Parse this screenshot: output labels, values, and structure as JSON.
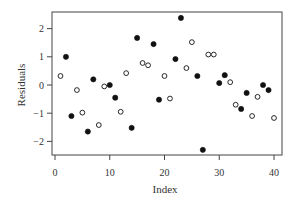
{
  "chart_data": {
    "type": "scatter",
    "title": "",
    "xlabel": "Index",
    "ylabel": "Residuals",
    "xlim": [
      -0.5,
      41.5
    ],
    "ylim": [
      -2.5,
      2.6
    ],
    "xticks": [
      0,
      10,
      20,
      30,
      40
    ],
    "yticks": [
      -2,
      -1,
      0,
      1,
      2
    ],
    "grid": false,
    "legend": null,
    "series": [
      {
        "name": "filled",
        "marker": "filled-circle",
        "color": "#111111",
        "points": [
          [
            2,
            1.0
          ],
          [
            3,
            -1.1
          ],
          [
            6,
            -1.65
          ],
          [
            7,
            0.2
          ],
          [
            10,
            0.0
          ],
          [
            11,
            -0.45
          ],
          [
            14,
            -1.52
          ],
          [
            15,
            1.67
          ],
          [
            18,
            1.45
          ],
          [
            19,
            -0.52
          ],
          [
            22,
            0.92
          ],
          [
            23,
            2.38
          ],
          [
            26,
            0.32
          ],
          [
            27,
            -2.3
          ],
          [
            30,
            0.07
          ],
          [
            31,
            0.35
          ],
          [
            34,
            -0.85
          ],
          [
            35,
            -0.28
          ],
          [
            38,
            0.0
          ],
          [
            39,
            -0.18
          ]
        ]
      },
      {
        "name": "open",
        "marker": "open-circle",
        "color": "#111111",
        "points": [
          [
            1,
            0.32
          ],
          [
            4,
            -0.18
          ],
          [
            5,
            -0.98
          ],
          [
            8,
            -1.42
          ],
          [
            9,
            -0.05
          ],
          [
            12,
            -0.95
          ],
          [
            13,
            0.42
          ],
          [
            16,
            0.78
          ],
          [
            17,
            0.7
          ],
          [
            20,
            0.32
          ],
          [
            21,
            -0.48
          ],
          [
            24,
            0.6
          ],
          [
            25,
            1.52
          ],
          [
            28,
            1.08
          ],
          [
            29,
            1.08
          ],
          [
            32,
            0.1
          ],
          [
            33,
            -0.7
          ],
          [
            36,
            -1.1
          ],
          [
            37,
            -0.42
          ],
          [
            40,
            -1.17
          ]
        ]
      }
    ]
  },
  "labels": {
    "xlabel": "Index",
    "ylabel": "Residuals",
    "xticks": [
      "0",
      "10",
      "20",
      "30",
      "40"
    ],
    "yticks": [
      "-2",
      "-1",
      "0",
      "1",
      "2"
    ]
  }
}
